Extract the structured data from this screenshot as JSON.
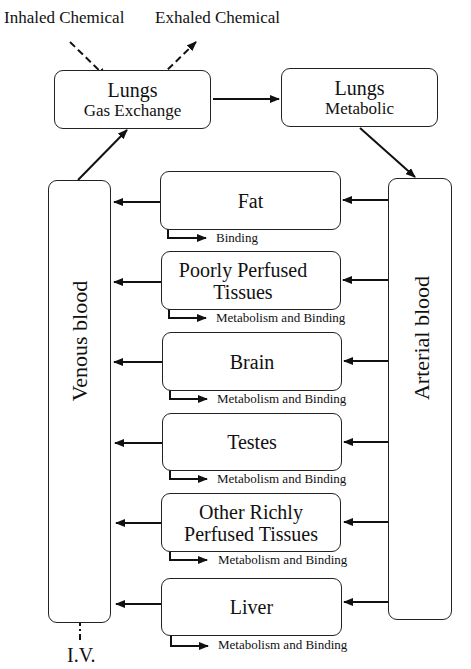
{
  "inputs": {
    "inhaled": "Inhaled Chemical",
    "exhaled": "Exhaled Chemical",
    "iv": "I.V."
  },
  "lungs_gas": {
    "title": "Lungs",
    "subtitle": "Gas Exchange"
  },
  "lungs_met": {
    "title": "Lungs",
    "subtitle": "Metabolic"
  },
  "venous": "Venous blood",
  "arterial": "Arterial blood",
  "compartments": [
    {
      "line1": "Fat",
      "line2": "",
      "side": "Binding"
    },
    {
      "line1": "Poorly Perfused",
      "line2": "Tissues",
      "side": "Metabolism and Binding"
    },
    {
      "line1": "Brain",
      "line2": "",
      "side": "Metabolism and Binding"
    },
    {
      "line1": "Testes",
      "line2": "",
      "side": "Metabolism and Binding"
    },
    {
      "line1": "Other Richly",
      "line2": "Perfused Tissues",
      "side": "Metabolism and Binding"
    },
    {
      "line1": "Liver",
      "line2": "",
      "side": "Metabolism and Binding"
    }
  ]
}
